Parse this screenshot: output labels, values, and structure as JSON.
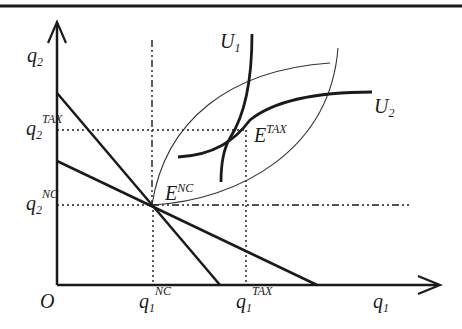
{
  "diagram": {
    "type": "economics-equilibrium-diagram",
    "axes": {
      "origin_label": "O",
      "x_axis": {
        "label": "q",
        "label_sub": "1"
      },
      "y_axis": {
        "label": "q",
        "label_sub": "2"
      }
    },
    "tick_labels": {
      "q1_nc": {
        "base": "q",
        "sub": "1",
        "sup": "NC"
      },
      "q1_tax": {
        "base": "q",
        "sub": "1",
        "sup": "TAX"
      },
      "q2_nc": {
        "base": "q",
        "sub": "2",
        "sup": "NC"
      },
      "q2_tax": {
        "base": "q",
        "sub": "2",
        "sup": "TAX"
      }
    },
    "points": {
      "e_nc": {
        "base": "E",
        "sup": "NC"
      },
      "e_tax": {
        "base": "E",
        "sup": "TAX"
      }
    },
    "curves": {
      "u1": {
        "base": "U",
        "sub": "1"
      },
      "u2": {
        "base": "U",
        "sub": "2"
      }
    },
    "colors": {
      "ink": "#1a1a1a",
      "thin_ink": "#333333",
      "background": "#ffffff"
    }
  }
}
